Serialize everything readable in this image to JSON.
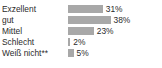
{
  "chart_data": {
    "type": "bar",
    "orientation": "horizontal",
    "title": "",
    "xlabel": "",
    "ylabel": "",
    "categories": [
      "Exzellent",
      "gut",
      "Mittel",
      "Schlecht",
      "Weiß nicht**"
    ],
    "values": [
      31,
      38,
      23,
      2,
      5
    ],
    "value_labels": [
      "31%",
      "38%",
      "23%",
      "2%",
      "5%"
    ],
    "unit": "%",
    "xlim": [
      0,
      50
    ],
    "grid": false,
    "legend": false,
    "bar_color": "#a8a8a8",
    "text_color": "#2b2b2b",
    "background": "#ffffff",
    "footnote_marker": "**"
  },
  "title_remnant": "",
  "rows": [
    {
      "label": "Exzellent",
      "value_label": "31%",
      "value": 31
    },
    {
      "label": "gut",
      "value_label": "38%",
      "value": 38
    },
    {
      "label": "Mittel",
      "value_label": "23%",
      "value": 23
    },
    {
      "label": "Schlecht",
      "value_label": "2%",
      "value": 2
    },
    {
      "label": "Weiß nicht**",
      "value_label": "5%",
      "value": 5
    }
  ]
}
